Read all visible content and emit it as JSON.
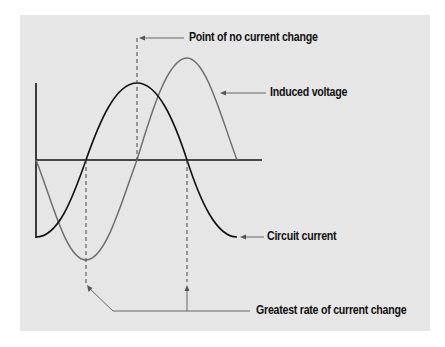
{
  "diagram": {
    "type": "waveform-phase-diagram",
    "labels": {
      "no_change": "Point of no current change",
      "induced_voltage": "Induced voltage",
      "circuit_current": "Circuit current",
      "greatest_rate": "Greatest rate of current change"
    },
    "series": [
      {
        "name": "Circuit current",
        "color": "#111111",
        "phase": "cosine-inverted",
        "starts_at": "minimum"
      },
      {
        "name": "Induced voltage",
        "color": "#666666",
        "phase": "sine-inverted",
        "starts_at": "zero",
        "amplitude_relative": 1.3
      }
    ],
    "colors": {
      "panel_bg": "#e6e6e6",
      "axis": "#111111",
      "current": "#111111",
      "voltage": "#6e6e6e",
      "leader": "#666666"
    }
  }
}
